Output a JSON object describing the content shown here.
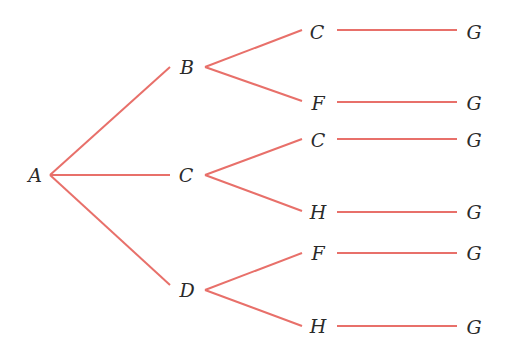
{
  "diagram": {
    "type": "tree",
    "edge_color": "#e8706a",
    "label_color": "#2a2a2a",
    "nodes": [
      {
        "id": "n0",
        "label": "A",
        "x": 35,
        "y": 175
      },
      {
        "id": "n1",
        "label": "B",
        "x": 187,
        "y": 67
      },
      {
        "id": "n2",
        "label": "C",
        "x": 186,
        "y": 175
      },
      {
        "id": "n3",
        "label": "D",
        "x": 187,
        "y": 290
      },
      {
        "id": "n4",
        "label": "C",
        "x": 317,
        "y": 32
      },
      {
        "id": "n5",
        "label": "F",
        "x": 318,
        "y": 103
      },
      {
        "id": "n6",
        "label": "C",
        "x": 318,
        "y": 140
      },
      {
        "id": "n7",
        "label": "H",
        "x": 318,
        "y": 212
      },
      {
        "id": "n8",
        "label": "F",
        "x": 318,
        "y": 253
      },
      {
        "id": "n9",
        "label": "H",
        "x": 318,
        "y": 326
      },
      {
        "id": "n10",
        "label": "G",
        "x": 474,
        "y": 32
      },
      {
        "id": "n11",
        "label": "G",
        "x": 474,
        "y": 103
      },
      {
        "id": "n12",
        "label": "G",
        "x": 474,
        "y": 140
      },
      {
        "id": "n13",
        "label": "G",
        "x": 474,
        "y": 212
      },
      {
        "id": "n14",
        "label": "G",
        "x": 474,
        "y": 253
      },
      {
        "id": "n15",
        "label": "G",
        "x": 474,
        "y": 327
      }
    ],
    "edges": [
      {
        "from": "n0",
        "to": "n1",
        "x1": 50,
        "y1": 175,
        "x2": 170,
        "y2": 67
      },
      {
        "from": "n0",
        "to": "n2",
        "x1": 50,
        "y1": 175,
        "x2": 170,
        "y2": 175
      },
      {
        "from": "n0",
        "to": "n3",
        "x1": 50,
        "y1": 175,
        "x2": 170,
        "y2": 285
      },
      {
        "from": "n1",
        "to": "n4",
        "x1": 205,
        "y1": 67,
        "x2": 302,
        "y2": 30
      },
      {
        "from": "n1",
        "to": "n5",
        "x1": 205,
        "y1": 67,
        "x2": 302,
        "y2": 101
      },
      {
        "from": "n2",
        "to": "n6",
        "x1": 205,
        "y1": 175,
        "x2": 302,
        "y2": 139
      },
      {
        "from": "n2",
        "to": "n7",
        "x1": 205,
        "y1": 175,
        "x2": 302,
        "y2": 211
      },
      {
        "from": "n3",
        "to": "n8",
        "x1": 205,
        "y1": 290,
        "x2": 302,
        "y2": 253
      },
      {
        "from": "n3",
        "to": "n9",
        "x1": 205,
        "y1": 290,
        "x2": 302,
        "y2": 326
      },
      {
        "from": "n4",
        "to": "n10",
        "x1": 337,
        "y1": 30,
        "x2": 457,
        "y2": 30
      },
      {
        "from": "n5",
        "to": "n11",
        "x1": 337,
        "y1": 102,
        "x2": 457,
        "y2": 102
      },
      {
        "from": "n6",
        "to": "n12",
        "x1": 337,
        "y1": 139,
        "x2": 457,
        "y2": 139
      },
      {
        "from": "n7",
        "to": "n13",
        "x1": 337,
        "y1": 212,
        "x2": 457,
        "y2": 212
      },
      {
        "from": "n8",
        "to": "n14",
        "x1": 337,
        "y1": 253,
        "x2": 457,
        "y2": 253
      },
      {
        "from": "n9",
        "to": "n15",
        "x1": 337,
        "y1": 326,
        "x2": 457,
        "y2": 326
      }
    ]
  }
}
